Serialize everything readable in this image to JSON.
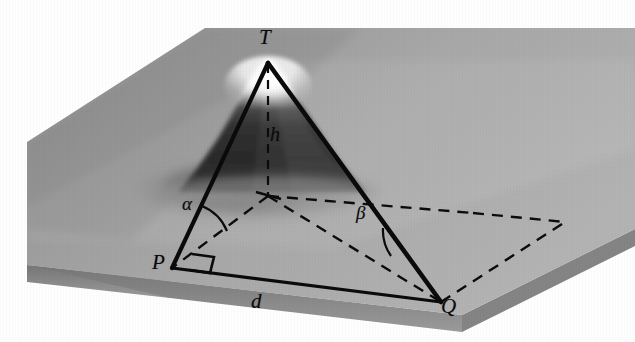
{
  "caption": {
    "text": "EXERCISE 9:"
  },
  "figure": {
    "labels": {
      "apex": "T",
      "height": "h",
      "point_p": "P",
      "point_q": "Q",
      "distance": "d",
      "angle_alpha": "α",
      "angle_beta": "β"
    },
    "colors": {
      "plane_top": "#9a9a9a",
      "plane_top_light": "#b2b2b2",
      "plane_side": "#6e6e6e",
      "mountain_dark": "#3a3a3a",
      "mountain_snow": "#f2f2f2",
      "line": "#0c0c0c",
      "page": "#ffffff",
      "caption": "#6f6f6f"
    },
    "geometry": {
      "apex_point": [
        268,
        63
      ],
      "foot_point": [
        268,
        196
      ],
      "point_p": [
        172,
        268
      ],
      "point_q": [
        441,
        302
      ],
      "dashed_far_right": [
        565,
        222
      ],
      "dashed_far_mid": [
        473,
        213
      ],
      "right_angle_marker_at": "P"
    }
  }
}
